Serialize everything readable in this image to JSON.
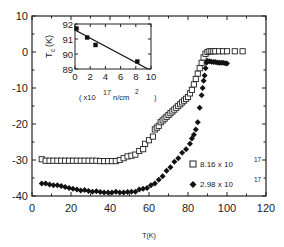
{
  "chart_data": {
    "type": "scatter",
    "title": "",
    "xlabel": "T(K)",
    "ylabel": "",
    "xlim": [
      0,
      120
    ],
    "ylim": [
      -40,
      10
    ],
    "x_ticks": [
      "0",
      "20",
      "40",
      "60",
      "80",
      "100",
      "120"
    ],
    "y_ticks": [
      "10",
      "0",
      "-10",
      "-20",
      "-30",
      "-40"
    ],
    "grid": false,
    "legend_position": "lower right inside",
    "series": [
      {
        "name": "8.16 x 10^17",
        "legend_mantissa": "8.16 x 10",
        "legend_exponent": "17",
        "marker": "open-square",
        "x": [
          5,
          7,
          9,
          11,
          13,
          15,
          17,
          19,
          21,
          23,
          25,
          27,
          29,
          31,
          33,
          35,
          37,
          39,
          41,
          43,
          45,
          47,
          49,
          51,
          53,
          55,
          57,
          58,
          60,
          62,
          63,
          64,
          65,
          66,
          67,
          68,
          69,
          70,
          71,
          72,
          73,
          74,
          75,
          76,
          77,
          78,
          79,
          80,
          81,
          82,
          83,
          84,
          85,
          86,
          87,
          88,
          89,
          90,
          91,
          92,
          93,
          94,
          96,
          98,
          100,
          104,
          108
        ],
        "y": [
          -29.8,
          -30.2,
          -30.2,
          -30.2,
          -30.2,
          -30.2,
          -30.2,
          -30.2,
          -30.2,
          -30.2,
          -30.2,
          -30.2,
          -30.2,
          -30.2,
          -30.2,
          -30.3,
          -30.3,
          -30.3,
          -30.3,
          -30.3,
          -30.0,
          -29.5,
          -29.0,
          -28.8,
          -28.5,
          -27.5,
          -27.0,
          -25.5,
          -24.5,
          -23.5,
          -21.5,
          -21.0,
          -20.5,
          -19.5,
          -19.0,
          -18.5,
          -18.0,
          -17.5,
          -17.0,
          -16.5,
          -16.0,
          -15.5,
          -15.0,
          -14.5,
          -14.0,
          -13.5,
          -13.0,
          -12.5,
          -11.5,
          -10.5,
          -9.0,
          -7.5,
          -6.0,
          -4.5,
          -3.0,
          -1.5,
          -0.5,
          0.0,
          0.2,
          0.2,
          0.2,
          0.2,
          0.2,
          0.2,
          0.2,
          0.2,
          0.2
        ]
      },
      {
        "name": "2.98 x 10^17",
        "legend_mantissa": "2.98 x 10",
        "legend_exponent": "17",
        "marker": "filled-diamond",
        "x": [
          5,
          7,
          9,
          11,
          13,
          15,
          17,
          19,
          21,
          23,
          25,
          27,
          29,
          31,
          33,
          35,
          37,
          39,
          41,
          43,
          45,
          47,
          49,
          51,
          53,
          55,
          57,
          59,
          61,
          63,
          65,
          67,
          69,
          71,
          73,
          75,
          77,
          79,
          81,
          82,
          83,
          84,
          85,
          86,
          87,
          87.5,
          88,
          88.5,
          89,
          89.5,
          90,
          91,
          92,
          93,
          94,
          95,
          96,
          97,
          98,
          99,
          100
        ],
        "y": [
          -36.5,
          -36.5,
          -36.8,
          -37.0,
          -37.0,
          -37.2,
          -37.5,
          -37.8,
          -38.0,
          -38.2,
          -38.5,
          -38.3,
          -38.6,
          -38.8,
          -38.7,
          -38.9,
          -39.0,
          -39.0,
          -39.0,
          -38.8,
          -39.0,
          -39.0,
          -38.9,
          -38.8,
          -38.8,
          -38.2,
          -38.0,
          -37.8,
          -37.0,
          -36.5,
          -35.5,
          -34.5,
          -33.0,
          -32.0,
          -30.5,
          -29.5,
          -28.0,
          -27.0,
          -25.5,
          -24.0,
          -23.0,
          -21.5,
          -19.5,
          -15.5,
          -12.0,
          -10.0,
          -8.0,
          -6.5,
          -4.5,
          -3.0,
          -2.5,
          -2.6,
          -2.7,
          -2.8,
          -2.8,
          -2.9,
          -3.0,
          -3.0,
          -3.0,
          -3.1,
          -3.2
        ]
      }
    ],
    "inset": {
      "type": "scatter+line",
      "ylabel": "T_c(K)",
      "ylabel_main": "T",
      "ylabel_sub": "c",
      "ylabel_unit": "(K)",
      "xlabel_prefix": "( x10",
      "xlabel_exponent": "17",
      "xlabel_unit": "n/cm",
      "xlabel_unit_exponent": "2",
      "xlabel_suffix": ")",
      "xlim": [
        0,
        10
      ],
      "ylim": [
        89,
        92
      ],
      "x_ticks": [
        "0",
        "2",
        "4",
        "6",
        "8",
        "10"
      ],
      "y_ticks": [
        "92",
        "91",
        "90",
        "89"
      ],
      "points": {
        "x": [
          0.2,
          1.6,
          2.7,
          8.2
        ],
        "y": [
          91.7,
          91.1,
          90.6,
          89.5
        ]
      },
      "fit_line": {
        "x": [
          0,
          9.6
        ],
        "y": [
          91.6,
          89.0
        ]
      }
    }
  }
}
